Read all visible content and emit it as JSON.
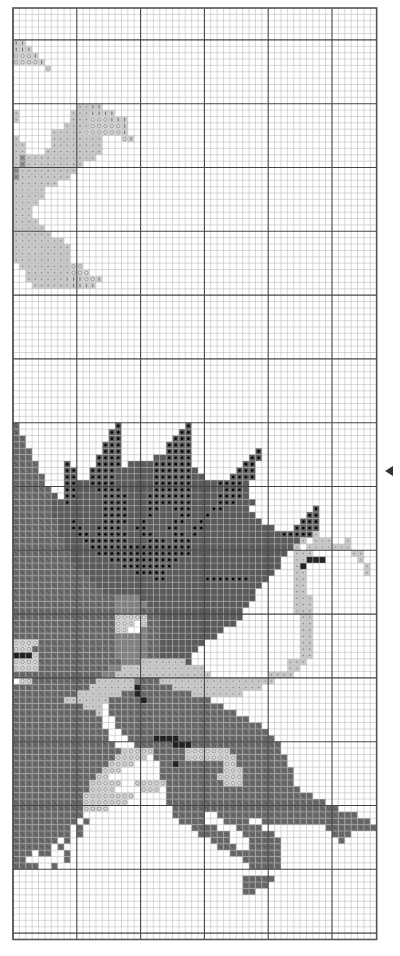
{
  "page": {
    "type": "cross-stitch chart page",
    "center_marker": "triangle-left"
  },
  "grid": {
    "cols": 57,
    "rows": 146,
    "major_every": 10,
    "major_col_offset": 0,
    "major_row_offset": 5
  },
  "palette": {
    ".": {
      "name": "empty",
      "fill": "#ffffff",
      "symbol": "none"
    },
    "b": {
      "name": "dark-gray-hatched",
      "fill": "#6b6b6b",
      "symbol": "diag"
    },
    "d": {
      "name": "dark-gray-dot",
      "fill": "#5a5a5a",
      "symbol": "dot"
    },
    "D": {
      "name": "dark-gray-solid",
      "fill": "#5a5a5a",
      "symbol": "none"
    },
    "m": {
      "name": "medium-gray",
      "fill": "#808080",
      "symbol": "none"
    },
    "l": {
      "name": "light-gray-cross",
      "fill": "#c9c9c9",
      "symbol": "plus"
    },
    "o": {
      "name": "light-gray-circle",
      "fill": "#dcdcdc",
      "symbol": "circle"
    },
    "i": {
      "name": "light-gray-bar",
      "fill": "#cfcfcf",
      "symbol": "bar"
    },
    "k": {
      "name": "black",
      "fill": "#222222",
      "symbol": "none"
    },
    "g": {
      "name": "gray-x",
      "fill": "#9a9a9a",
      "symbol": "x"
    }
  },
  "pattern": [
    ".........................................................",
    ".........................................................",
    ".........................................................",
    ".........................................................",
    ".........................................................",
    "ii.......................................................",
    "iii......................................................",
    "oooi.....................................................",
    "ooooi....................................................",
    ".....o...................................................",
    ".........................................................",
    ".........................................................",
    ".........................................................",
    ".........................................................",
    ".........................................................",
    "..........llii...........................................",
    "l........llliiii.........................................",
    "l........llloooiii.......................................",
    "........lllloooooi.......................................",
    "......lllllooooooi.......................................",
    "l.....llllllll...oi......................................",
    "ll....llllllll...........................................",
    "ll...lllllllll...........................................",
    "lglllllllllll............................................",
    "lglllllllll..............................................",
    "glllllllll...............................................",
    "gllllllll................................................",
    "lllllll..................................................",
    "lllll....................................................",
    "lllll....................................................",
    "llll.....................................................",
    "lll......................................................",
    "lll......................................................",
    "llll.....................................................",
    "lllll....................................................",
    "llllll...................................................",
    "llllllll.................................................",
    "lllllllll................................................",
    "lllllllll................................................",
    "lllllllll................................................",
    ".lllllllloo..............................................",
    "..lllllllooo.............................................",
    "..lllllliiiooi...........................................",
    "...lllllliiii............................................",
    ".........................................................",
    ".........................................................",
    ".........................................................",
    ".........................................................",
    ".........................................................",
    ".........................................................",
    ".........................................................",
    ".........................................................",
    ".........................................................",
    ".........................................................",
    ".........................................................",
    ".........................................................",
    ".........................................................",
    ".........................................................",
    ".........................................................",
    ".........................................................",
    ".........................................................",
    ".........................................................",
    ".........................................................",
    ".........................................................",
    ".........................................................",
    "b...............d..........d.............................",
    "b..............dd.........dd.............................",
    "bb.............dd........ddd.............................",
    "bb............ddd.......dddd.............................",
    "bbb...........ddd.......dddd..........d..................",
    "bbb..........dddd.....DDdddd.........dd..................",
    "bbbb....d....dddd.DDDDdddddd........dd...................",
    "bbbb....dd..ddddDDDDDDddddddD......ddd...................",
    "bbbbb...dd..ddddDDDDDDddddddDD....dddd...................",
    "bbbbb...ddDDddddDDDDDDddddddDDDDddddD....................",
    "bbbbbb..ddDDDddddDDDDDddddddDDDDDdddD....................",
    "bbbbbbD.ddDDDDddddDDDdddddddDDDDddddD....................",
    "bbbbbbDDdDDDDDddddDDDdddddddDDDDdddDDD...................",
    "bbbbbbDDDDDDDDddddDDDddDDdddDDDddDDDD..........d.........",
    "bbbbbbDDDDDDDDddddDDDdDDDDddDDdDDDDDDD........dd.........",
    "bbbbbbbDDdDDDDddddDDdDDDDddDDdDDDDDDDDD......ddd.........",
    "bbbbbbbDDddDDddddDDddDDDddDDddDDDDDDDDDDD...dddd.........",
    "bbbbbbbDDDddDdddddDDddDDDddDdDDDDDDDDDDDDDdddddl.........",
    "bbbbbbbbDDDdddddddDDDdddDdddDDDDDDDDDDDDDDDDDl.lll..l....",
    "bbbbbbbbDDDDddddddddddddddddDDDDDDDDDDDDDDDDl.lllllll....",
    "bbbbbbbbbDDDDdddddddddddddddDDDDDDDDDDDDDDD.lll......ll..",
    "bbbbbbbbbDDDDDDdddddddddddDDDDDDDDDDDDDDDD..llkkk.....l..",
    "bbbbbbbbbbDDDDDDDddddddddDDDDDDDDDDDDDDDDD..lk.........l.",
    "bbbbbbbbbbbDDDDDDDDdddddDDDDDDDDDDDDDDDDD...ll.........l.",
    "bbbbbbbbbbbbDDDDDDDDDDddDDDDDDdddddddDDD....ll...........",
    "bbbbbbbbbbbbbDDDDDDDDDDDDDDDDDDDDDDDDDD.....ll...........",
    "bbbbbbbbbbbbbbDDDDDDDDDDDDDDDDDDDDDDDD......ll...........",
    "bbbbbbbbbbbbbbbbmmmmDDDDDDDDDDDDDDDDDD......lll..........",
    "bbbbbbbbbbbbbbbbmmmmmDDDDDDDDDDDDDDDD.......lll..........",
    "bbbbbbbbbbbbbbbbmmmmbbDDDDDDDDDDDDDD........lll..........",
    "bbbbbbbbbbbbbbbbooooobbDDDDDDDDDDDDD.........ll..........",
    "bbbbbbbbbbbbbbbbooo.obbDDDDDDDDDDDD..........ll..........",
    "bbbbbbbbbbbbbbbboo..mbbDDDDDDDDDD............ll..........",
    "bbbbbbbbbbbbbbbbmmmmmbbDDDDDDDDD.............ll..........",
    "oooobbbbbbbbbbbbmmmmmbbDDDDDDD...............ll..........",
    "ooobbbbbbbbbbbbbmmmmmbbDDDDDD................ll..........",
    "kkkobbbbbbbbbbbbmmmmmbbDDDDD.................ll..........",
    "oooobbbbbbbbbbbbbmmmlllllllD...............lll...........",
    "oooobbbbbbbbbbbmmlllllllllllll.............ll............",
    "bbbbbbbbbbbbbbmmlllllllllllllll.........llll.............",
    ".oobbbbbbbbbbllllllmbbbllllllllllllllllll................",
    "bbbbbbbbbbbblllllllkbbbbbllllllllllllll..................",
    "bbbbbbbbbblllllllbbkbbbbbbbbllllllll.....................",
    "bbbbbbbblllllllbbbbbkbbbbbbbbbb..........................",
    "bbbbbbbbbbblll.bbbbbbbbbbbbbbbbbb........................",
    "bbbbbbbbbbbbbl.bbbbbbbbbbbbbbbbbbbb......................",
    "bbbbbbbbbbbbbb..bbbbbbbbbbbbbbbbbbbbb....................",
    "bbbbbbbbbbbbbb..bbbbbbbbbbbbbbbbbbbbbbb..................",
    "bbbbbbbbbbbbbbb..bbbbbbbbbbbbbbbbbbbbbbb.................",
    "bbbbbbbbbbbbbbb...bbbbkkkkbbbbbbbbbbbbbbb................",
    "bbbbbbbbbbbbbbbb...bbbbbbkkkbbbbbbbbbbbbbb...............",
    "bbbbbbbbbbbbbbbbbooooobbbbbooooooobbbbbbbb...............",
    "bbbbbbbbbbbbbbbbooooo.bbbbboooooooobbbbbbbb..............",
    "bbbbbbbbbbbbbbboooo....bbkbbbbbbboobbbbbbbb..............",
    "bbbbbbbbbbbbbbooo......bbbbbbbbbbooobbbbbbbb.............",
    "bbbbbbbbbbbbboo........bbbbbbbbboooobbbbbbbb.............",
    "bbbbbbbbbbbbooooo..ooooobbbbbbbbbooobbbbbbbb.............",
    "bbbbbbbbbbbboooo....ooo.bbbbbbbbbbbbbbbbbbbbb............",
    "bbbbbbbbbbboooooooo.....bbbbbbbbbbbbbbbbbbbbbbb..........",
    "bbbbbbbbbbbooooooo......bbbbbbbbbbbbbbbbbbbbbbbbb........",
    "bbbbbbbbbbboooo..........bbbbbbbbbbbbbbbbbbbbbbbbbb......",
    "bbbbbbbbbbb..............bbbbb..bbbbbbbbbbbbbbbbbbbbbb...",
    "bbbbbbbbbb.b..............bbbb...bbbb..bbbbbbbbbbbbbbbbb.",
    "bbbbbbbbb.b.................bbbb...bbbb..........bbbbbbbb",
    "bbbbbbbbb.b..................bbbbb..bbbbb.........bbb....",
    "bbbbbbb.b......................bbb...bbbbb.........b.....",
    "bbbbbb.b........................bbb..bbbbb...............",
    "bbb.bb..b.........................bbbbbbbb...............",
    "bb......b...........................bbbbbb...............",
    "bbbb..b..............................bbbbb...............",
    ".........................................................",
    "....................................bbbbb................",
    "....................................bbbb.................",
    "....................................bb...................",
    ".........................................................",
    ".........................................................",
    ".........................................................",
    ".........................................................",
    ".........................................................",
    ".........................................................",
    "........................................................."
  ]
}
